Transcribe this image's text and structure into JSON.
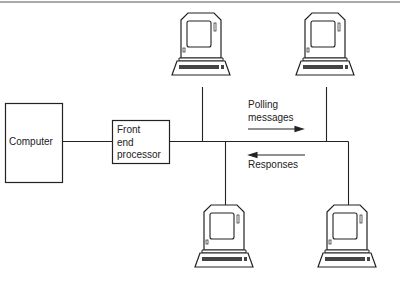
{
  "diagram": {
    "nodes": {
      "computer": {
        "label": "Computer"
      },
      "fep": {
        "lines": [
          "Front",
          "end",
          "processor"
        ]
      },
      "terminals": [
        {
          "id": "terminal-top-left"
        },
        {
          "id": "terminal-top-right"
        },
        {
          "id": "terminal-bottom-left"
        },
        {
          "id": "terminal-bottom-right"
        }
      ]
    },
    "annotations": {
      "polling": {
        "lines": [
          "Polling",
          "messages"
        ],
        "direction": "right"
      },
      "responses": {
        "label": "Responses",
        "direction": "left"
      }
    },
    "colors": {
      "line": "#222222",
      "background": "#ffffff"
    }
  }
}
